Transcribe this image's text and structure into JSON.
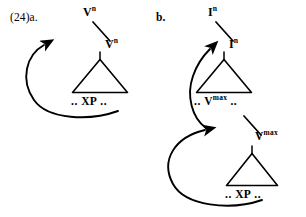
{
  "figure": {
    "example_number": "(24)",
    "width": 306,
    "height": 217,
    "ink_color": "#000000",
    "background_color": "#ffffff"
  },
  "tree_a": {
    "sub_label": "a.",
    "nodes": {
      "top": {
        "base": "V",
        "sup": "n",
        "text": "Vn"
      },
      "head": {
        "base": "V",
        "sup": "n",
        "text": "Vn"
      },
      "leaf": {
        "left_dots": "..",
        "text": "XP",
        "right_dots": ".."
      }
    },
    "movement_arrow": {
      "from": "leaf-xp",
      "to": "top-node",
      "direction": "up-left-loop"
    }
  },
  "tree_b": {
    "sub_label": "b.",
    "nodes": {
      "top": {
        "base": "I",
        "sup": "n",
        "text": "In"
      },
      "head": {
        "base": "I",
        "sup": "n",
        "text": "In"
      },
      "mid_leaf": {
        "left_dots": "..",
        "base": "V",
        "sup": "max",
        "text": "Vmax",
        "right_dots": ".."
      },
      "mid_head": {
        "base": "V",
        "sup": "max",
        "text": "Vmax"
      },
      "leaf": {
        "left_dots": "..",
        "text": "XP",
        "right_dots": ".."
      }
    },
    "movement_arrows": [
      {
        "from": "vmax-node",
        "to": "top-in-node",
        "direction": "up-left-loop"
      },
      {
        "from": "leaf-xp",
        "to": "vmax-node",
        "direction": "up-left-loop"
      }
    ]
  }
}
